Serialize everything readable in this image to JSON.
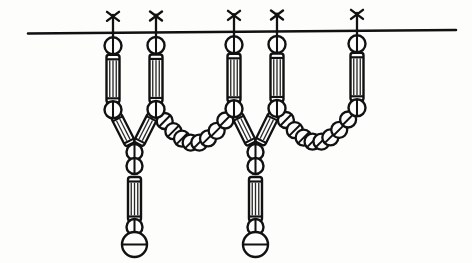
{
  "figure": {
    "title": "Beaded festoon / necklace construction line drawing",
    "domain_label": "Diagram",
    "canvas": {
      "width": 472,
      "height": 263
    },
    "background_color": "#fdfdfc",
    "ink_color": "#111111"
  },
  "geometry": {
    "suspension_wire": {
      "name": "horizontal suspension wire",
      "x_start": 28,
      "y_start": 33.5,
      "x_end": 456,
      "y_end": 30.0,
      "stroke_width": 2.6
    },
    "hanger_x_positions": [
      113,
      156,
      234,
      277,
      357
    ],
    "hanger_wire_y": [
      32.8,
      32.4,
      31.8,
      31.4,
      30.8
    ],
    "knot_mark": {
      "name": "x-knot",
      "arm_half_length": 7.5,
      "arm_spread_x": 6.0,
      "arm_spread_y": 9.0,
      "stem_drop": 16,
      "stroke_width": 2.4
    },
    "top_ring": {
      "name": "top suspension ring bead",
      "radius": 8.5,
      "center_offset_y": 13,
      "stroke_width": 2.4,
      "inner_line": "vertical"
    },
    "vertical_tube": {
      "name": "vertical tube bead",
      "width": 13,
      "height": 48,
      "top_offset_y": 22,
      "stroke_width": 2.4,
      "hatch_lines": 3,
      "cap_bar": true
    },
    "junction_ring": {
      "name": "tube lower ring bead",
      "radius": 8.5,
      "stroke_width": 2.4,
      "inner_line": "vertical"
    },
    "swag_bead": {
      "name": "swag chain round bead",
      "radius": 8.0,
      "stroke_width": 2.3,
      "inner_line": "diagonal-slash"
    },
    "angled_tube": {
      "name": "angled tube bead at Y-junction",
      "width": 11,
      "length": 32,
      "tilt_degrees": 26,
      "stroke_width": 2.3,
      "hatch_lines": 2
    },
    "pendant": {
      "name": "pendant drop",
      "ring_radius_small": 8.0,
      "tube_width": 13,
      "tube_height": 44,
      "terminal_radius": 12.5,
      "stroke_width": 2.4
    }
  },
  "elements": {
    "hangers": [
      {
        "id": "hanger-1",
        "label": "Hanger 1",
        "x": 113,
        "has_knot": true,
        "has_top_ring": true,
        "has_vertical_tube": true,
        "has_junction_ring": true,
        "role": "left terminus + left arm of Y-junction 1"
      },
      {
        "id": "hanger-2",
        "label": "Hanger 2",
        "x": 156,
        "has_knot": true,
        "has_top_ring": true,
        "has_vertical_tube": true,
        "has_junction_ring": true,
        "role": "right arm of Y-junction 1 + left anchor of swag A"
      },
      {
        "id": "hanger-3",
        "label": "Hanger 3",
        "x": 234,
        "has_knot": true,
        "has_top_ring": true,
        "has_vertical_tube": true,
        "has_junction_ring": true,
        "role": "right anchor of swag A + left arm of Y-junction 2"
      },
      {
        "id": "hanger-4",
        "label": "Hanger 4",
        "x": 277,
        "has_knot": true,
        "has_top_ring": true,
        "has_vertical_tube": true,
        "has_junction_ring": true,
        "role": "right arm of Y-junction 2 + left anchor of swag B"
      },
      {
        "id": "hanger-5",
        "label": "Hanger 5",
        "x": 357,
        "has_knot": true,
        "has_top_ring": true,
        "has_vertical_tube": true,
        "has_junction_ring": true,
        "role": "right anchor of swag B + right terminus"
      }
    ],
    "swags": [
      {
        "id": "swag-a",
        "label": "Swag A",
        "from_hanger": "hanger-2",
        "to_hanger": "hanger-3",
        "bead_count": 8,
        "sag_depth": 34,
        "bead_type": "round slashed bead"
      },
      {
        "id": "swag-b",
        "label": "Swag B",
        "from_hanger": "hanger-4",
        "to_hanger": "hanger-5",
        "bead_count": 8,
        "sag_depth": 34,
        "bead_type": "round slashed bead"
      }
    ],
    "junctions": [
      {
        "id": "junction-1",
        "label": "Y-junction 1",
        "left_hanger": "hanger-1",
        "right_hanger": "hanger-2",
        "apex_x": 134.5,
        "apex_y": 152,
        "pendant": "pendant-1"
      },
      {
        "id": "junction-2",
        "label": "Y-junction 2",
        "left_hanger": "hanger-3",
        "right_hanger": "hanger-4",
        "apex_x": 255.5,
        "apex_y": 152,
        "pendant": "pendant-2"
      }
    ],
    "pendants": [
      {
        "id": "pendant-1",
        "label": "Pendant drop 1",
        "x": 134.5,
        "top_y": 152,
        "parts": [
          "ring bead",
          "ring bead",
          "vertical tube bead",
          "ring bead",
          "large terminal bead"
        ],
        "terminal_inner_line": "horizontal"
      },
      {
        "id": "pendant-2",
        "label": "Pendant drop 2",
        "x": 255.5,
        "top_y": 152,
        "parts": [
          "ring bead",
          "ring bead",
          "vertical tube bead",
          "ring bead",
          "large terminal bead"
        ],
        "terminal_inner_line": "horizontal"
      }
    ]
  },
  "legend": {
    "counts_label": "Component counts",
    "hanger_count": 5,
    "swag_count": 2,
    "junction_count": 2,
    "pendant_count": 2
  }
}
